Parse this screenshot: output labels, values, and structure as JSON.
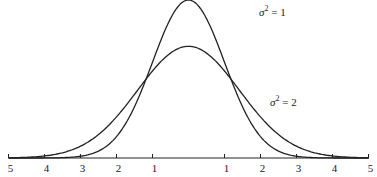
{
  "chart_data": {
    "type": "line",
    "title": "",
    "xlabel": "",
    "ylabel": "",
    "xlim": [
      -5,
      5
    ],
    "x_tick_labels": [
      "5",
      "4",
      "3",
      "2",
      "1",
      "1",
      "2",
      "3",
      "4",
      "5"
    ],
    "x_tick_values": [
      -5,
      -4,
      -3,
      -2,
      -1,
      1,
      2,
      3,
      4,
      5
    ],
    "grid": false,
    "series": [
      {
        "name": "σ² = 1",
        "distribution": "normal",
        "mean": 0,
        "variance": 1,
        "peak": 0.399
      },
      {
        "name": "σ² = 2",
        "distribution": "normal",
        "mean": 0,
        "variance": 2,
        "peak": 0.282
      }
    ],
    "annotations": [
      {
        "text": "σ² = 1",
        "near_series": "σ² = 1",
        "position": "upper right of peak"
      },
      {
        "text": "σ² = 2",
        "near_series": "σ² = 2",
        "position": "right tail"
      }
    ]
  },
  "labels": {
    "s1_sym": "σ",
    "s1_exp": "2",
    "s1_rest": " = 1",
    "s2_sym": "σ",
    "s2_exp": "2",
    "s2_rest": " = 2"
  },
  "ticks": [
    "5",
    "4",
    "3",
    "2",
    "1",
    "1",
    "2",
    "3",
    "4",
    "5"
  ]
}
